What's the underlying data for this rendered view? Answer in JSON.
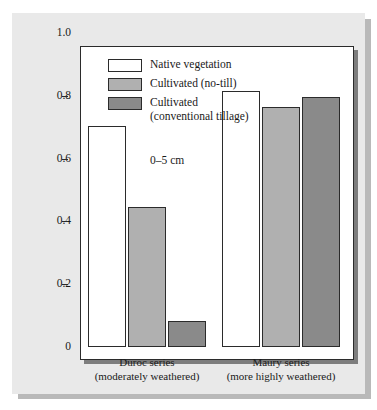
{
  "chart_data": {
    "type": "bar",
    "title": "",
    "xlabel": "",
    "ylabel": "Normalized stability index",
    "ylim": [
      0,
      1.0
    ],
    "grid": false,
    "legend_position": "inside-top-left",
    "categories": [
      "Duroc series\n(moderately weathered)",
      "Maury series\n(more highly weathered)"
    ],
    "category_lines": [
      [
        "Duroc series",
        "(moderately weathered)"
      ],
      [
        "Maury series",
        "(more highly weathered)"
      ]
    ],
    "series": [
      {
        "name": "Native vegetation",
        "color": "#ffffff",
        "values": [
          0.705,
          0.815
        ]
      },
      {
        "name": "Cultivated (no-till)",
        "color": "#b0b0b0",
        "values": [
          0.447,
          0.765
        ]
      },
      {
        "name": "Cultivated (conventional tillage)",
        "color": "#8a8a8a",
        "values": [
          0.083,
          0.795
        ]
      }
    ],
    "y_ticks": [
      {
        "value": 1.0,
        "label": "1.0"
      },
      {
        "value": 0.8,
        "label": "0.8"
      },
      {
        "value": 0.6,
        "label": "0.6"
      },
      {
        "value": 0.4,
        "label": "0.4"
      },
      {
        "value": 0.2,
        "label": "0.2"
      },
      {
        "value": 0.0,
        "label": "0"
      }
    ],
    "annotations": [
      {
        "text": "0–5 cm",
        "x_frac": 0.3,
        "y_frac": 0.66
      }
    ]
  },
  "legend": {
    "items": [
      {
        "label_line1": "Native vegetation",
        "label_line2": "",
        "color": "#ffffff"
      },
      {
        "label_line1": "Cultivated (no-till)",
        "label_line2": "",
        "color": "#b0b0b0"
      },
      {
        "label_line1": "Cultivated",
        "label_line2": "(conventional tillage)",
        "color": "#8a8a8a"
      }
    ]
  },
  "axes": {
    "y_title": "Normalized stability index"
  },
  "colors": {
    "panel_background": "#e9e9e9",
    "plot_background": "#ffffff",
    "axis_line": "#2b2b2b",
    "shadow": "#b9b9b9",
    "series_native": "#ffffff",
    "series_no_till": "#b0b0b0",
    "series_conventional": "#8a8a8a"
  }
}
